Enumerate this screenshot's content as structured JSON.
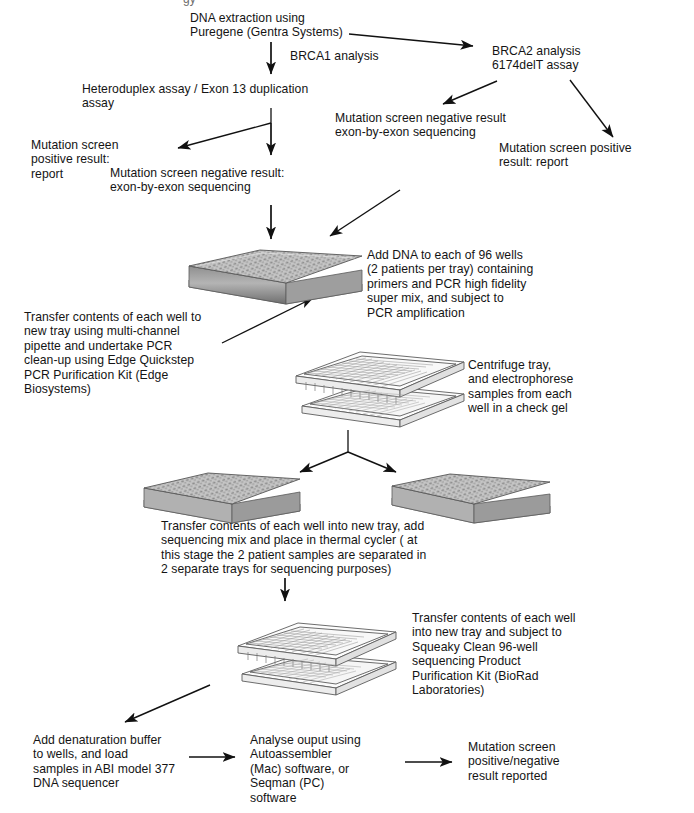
{
  "document": {
    "kind": "laboratory-workflow-flowchart",
    "title_cropped_fragment": "gy"
  },
  "colors": {
    "ink": "#141414",
    "tray_fill": "#c9c9c9",
    "tray_shade": "#9a9a9a",
    "tray_light": "#efefef",
    "outline": "#4a4a4a",
    "background": "#ffffff"
  },
  "nodes": [
    {
      "id": "dna-extraction",
      "text": "DNA extraction using\nPuregene (Gentra Systems)"
    },
    {
      "id": "brca1-analysis",
      "text": "BRCA1 analysis"
    },
    {
      "id": "brca2-analysis",
      "text": "BRCA2 analysis\n6174delT assay"
    },
    {
      "id": "heteroduplex-assay",
      "text": "Heteroduplex assay / Exon 13 duplication\nassay"
    },
    {
      "id": "mutation-positive-left",
      "text": "Mutation screen\npositive result:\nreport"
    },
    {
      "id": "mutation-negative-left",
      "text": "Mutation screen negative result:\nexon-by-exon sequencing"
    },
    {
      "id": "mutation-negative-right",
      "text": "Mutation screen negative result\nexon-by-exon sequencing"
    },
    {
      "id": "mutation-positive-right",
      "text": "Mutation screen positive\nresult: report"
    },
    {
      "id": "add-dna-96-wells",
      "text": "Add DNA to each of 96 wells\n(2 patients per tray) containing\nprimers and PCR high fidelity\nsuper mix, and  subject to\nPCR amplification"
    },
    {
      "id": "transfer-pcr-cleanup",
      "text": "Transfer contents of each well to\nnew tray using multi-channel\npipette and undertake PCR\nclean-up using  Edge Quickstep\nPCR Purification Kit (Edge\nBiosystems)"
    },
    {
      "id": "centrifuge-electrophorese",
      "text": "Centrifuge  tray,\nand electrophorese\nsamples from each\nwell in a check gel"
    },
    {
      "id": "transfer-thermal-cycler",
      "text": "Transfer contents of each well into new tray, add\nsequencing mix  and place in thermal cycler ( at\nthis stage the 2 patient samples are separated in\n2 separate trays for sequencing purposes)"
    },
    {
      "id": "squeaky-clean",
      "text": "Transfer contents of each well\ninto new tray and subject to\nSqueaky Clean 96-well\nsequencing Product\nPurification Kit (BioRad\nLaboratories)"
    },
    {
      "id": "denaturation-buffer",
      "text": "Add denaturation buffer\nto wells, and load\nsamples in ABI model 377\nDNA sequencer"
    },
    {
      "id": "analyse-output",
      "text": "Analyse ouput using\nAutoassembler\n(Mac) software, or\nSeqman (PC)\nsoftware"
    },
    {
      "id": "final-result",
      "text": "Mutation screen\npositive/negative\nresult reported"
    }
  ],
  "images": [
    {
      "id": "tray-pcr-plate",
      "alt": "96-well microplate, solid grey, 3D view"
    },
    {
      "id": "tray-exploded-cleanup",
      "alt": "96-well microplate exploded above a second plate"
    },
    {
      "id": "tray-left-sequencing",
      "alt": "96-well microplate, solid grey, 3D view"
    },
    {
      "id": "tray-right-sequencing",
      "alt": "96-well microplate, solid grey, 3D view"
    },
    {
      "id": "tray-exploded-squeaky",
      "alt": "96-well microplate exploded above a second plate"
    }
  ],
  "arrows": [
    {
      "id": "arrow-extraction-to-brca2",
      "from": "dna-extraction",
      "to": "brca2-analysis"
    },
    {
      "id": "arrow-extraction-to-brca1",
      "from": "dna-extraction",
      "to": "heteroduplex-assay"
    },
    {
      "id": "arrow-brca2-to-negative",
      "from": "brca2-analysis",
      "to": "mutation-negative-right"
    },
    {
      "id": "arrow-brca2-to-positive",
      "from": "brca2-analysis",
      "to": "mutation-positive-right"
    },
    {
      "id": "arrow-hetero-to-positive",
      "from": "heteroduplex-assay",
      "to": "mutation-positive-left"
    },
    {
      "id": "arrow-hetero-to-negative",
      "from": "heteroduplex-assay",
      "to": "mutation-negative-left"
    },
    {
      "id": "arrow-negleft-to-tray",
      "from": "mutation-negative-left",
      "to": "tray-pcr-plate"
    },
    {
      "id": "arrow-negright-to-tray",
      "from": "mutation-negative-right",
      "to": "tray-pcr-plate"
    },
    {
      "id": "arrow-tray-to-cleanup",
      "from": "tray-pcr-plate",
      "to": "tray-exploded-cleanup"
    },
    {
      "id": "arrow-cleanup-split-left",
      "from": "tray-exploded-cleanup",
      "to": "tray-left-sequencing"
    },
    {
      "id": "arrow-cleanup-split-right",
      "from": "tray-exploded-cleanup",
      "to": "tray-right-sequencing"
    },
    {
      "id": "arrow-thermal-to-squeaky",
      "from": "transfer-thermal-cycler",
      "to": "tray-exploded-squeaky"
    },
    {
      "id": "arrow-squeaky-to-denature",
      "from": "tray-exploded-squeaky",
      "to": "denaturation-buffer"
    },
    {
      "id": "arrow-denature-to-analyse",
      "from": "denaturation-buffer",
      "to": "analyse-output"
    },
    {
      "id": "arrow-analyse-to-result",
      "from": "analyse-output",
      "to": "final-result"
    }
  ]
}
